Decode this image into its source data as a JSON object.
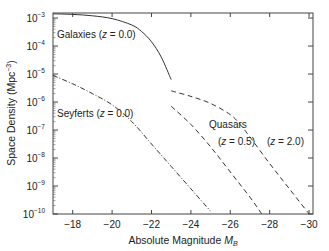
{
  "chart_data": {
    "type": "line",
    "title": "",
    "xlabel": "Absolute Magnitude M_B",
    "xlabel_main": "Absolute Magnitude ",
    "xlabel_sym": "M",
    "xlabel_sub": "B",
    "ylabel": "Space Density (Mpc^-3)",
    "ylabel_main": "Space Density (Mpc",
    "ylabel_exp": "−3",
    "ylabel_close": ")",
    "xlim": [
      -17,
      -30.2
    ],
    "ylim_log10": [
      -10,
      -2.82
    ],
    "y_scale": "log",
    "grid": false,
    "legend": "none (inline annotations)",
    "x_ticks": [
      -18,
      -20,
      -22,
      -24,
      -26,
      -28,
      -30
    ],
    "x_tick_labels": [
      "−18",
      "−20",
      "−22",
      "−24",
      "−26",
      "−28",
      "−30"
    ],
    "y_ticks_log10": [
      -3,
      -4,
      -5,
      -6,
      -7,
      -8,
      -9,
      -10
    ],
    "y_tick_labels": [
      "−3",
      "−4",
      "−5",
      "−6",
      "−7",
      "−8",
      "−9",
      "−10"
    ],
    "series": [
      {
        "name": "Galaxies (z = 0.0)",
        "style": "solid",
        "x": [
          -17,
          -18,
          -19,
          -20,
          -21,
          -21.5,
          -22,
          -22.5,
          -23.0
        ],
        "log10_y": [
          -2.85,
          -2.87,
          -2.92,
          -3.02,
          -3.25,
          -3.48,
          -3.85,
          -4.4,
          -5.2
        ]
      },
      {
        "name": "Seyferts (z = 0.0)",
        "style": "dash-dot",
        "x": [
          -17,
          -18,
          -19,
          -20,
          -21,
          -22,
          -23,
          -24,
          -25
        ],
        "log10_y": [
          -5.05,
          -5.35,
          -5.7,
          -6.1,
          -6.7,
          -7.5,
          -8.3,
          -9.1,
          -9.9
        ]
      },
      {
        "name": "Quasars (z = 0.5)",
        "style": "dashed",
        "x": [
          -23.0,
          -24,
          -25,
          -26,
          -27,
          -27.6
        ],
        "log10_y": [
          -6.15,
          -6.8,
          -7.6,
          -8.5,
          -9.4,
          -10.0
        ]
      },
      {
        "name": "Quasars (z = 2.0)",
        "style": "dashed",
        "x": [
          -23.0,
          -24,
          -25,
          -26,
          -26.5,
          -27,
          -28,
          -29,
          -30
        ],
        "log10_y": [
          -5.6,
          -5.8,
          -6.05,
          -6.45,
          -6.8,
          -7.25,
          -8.2,
          -9.1,
          -10.0
        ]
      }
    ],
    "annotations": [
      {
        "text": "Galaxies",
        "z_label": "z = 0.0"
      },
      {
        "text": "Seyferts",
        "z_label": "z = 0.0"
      },
      {
        "text": "Quasars"
      },
      {
        "text": "z = 0.5"
      },
      {
        "text": "z = 2.0"
      }
    ]
  },
  "labels": {
    "galaxies": "Galaxies (",
    "galaxies_z": "z",
    "galaxies_val": " = 0.0)",
    "seyferts": "Seyferts (",
    "seyferts_z": "z",
    "seyferts_val": " = 0.0)",
    "quasars": "Quasars",
    "q05_open": "(",
    "q05_z": "z",
    "q05_val": " = 0.5)",
    "q20_open": "(",
    "q20_z": "z",
    "q20_val": " = 2.0)",
    "ten": "10"
  }
}
